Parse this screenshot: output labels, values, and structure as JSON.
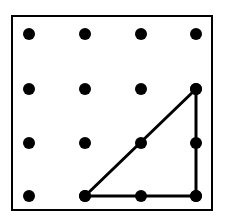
{
  "figure": {
    "name": "geoboard-right-triangle",
    "title": "",
    "canvas": {
      "width": 225,
      "height": 223,
      "background": "#ffffff"
    },
    "board": {
      "name": "geoboard-frame",
      "x": 11,
      "y": 15,
      "width": 202,
      "height": 196,
      "fill": "#ffffff",
      "stroke_color": "#000000",
      "stroke_width": 2
    },
    "grid": {
      "rows": 4,
      "columns": 4,
      "dot_radius": 6,
      "dot_color": "#000000",
      "column_x": [
        29,
        85,
        141,
        196
      ],
      "row_y": [
        34,
        89,
        143,
        196
      ],
      "peg_labels": [
        [
          "A1",
          "B1",
          "C1",
          "D1"
        ],
        [
          "A2",
          "B2",
          "C2",
          "D2"
        ],
        [
          "A3",
          "B3",
          "C3",
          "D3"
        ],
        [
          "A4",
          "B4",
          "C4",
          "D4"
        ]
      ]
    },
    "shape": {
      "name": "right-triangle",
      "type": "polygon",
      "stroke_color": "#000000",
      "stroke_width": 3,
      "fill": "none",
      "vertices": [
        {
          "label": "bottom-left",
          "grid": [
            1,
            3
          ],
          "x": 85,
          "y": 196
        },
        {
          "label": "top-right",
          "grid": [
            3,
            1
          ],
          "x": 196,
          "y": 89
        },
        {
          "label": "bottom-right",
          "grid": [
            3,
            3
          ],
          "x": 196,
          "y": 196
        }
      ],
      "points_path": "85,196 196,89 196,196",
      "legs": {
        "base_units": 2,
        "height_units": 2
      },
      "pegs_on_perimeter": 6,
      "pegs_interior": 1
    }
  }
}
